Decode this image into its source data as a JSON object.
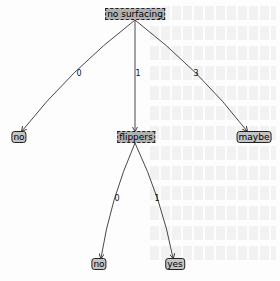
{
  "tree": {
    "root": {
      "label": "no surfacing",
      "type": "decision"
    },
    "nodes": [
      {
        "id": "root",
        "label": "no surfacing",
        "type": "decision"
      },
      {
        "id": "leaf_no_1",
        "label": "no",
        "type": "leaf"
      },
      {
        "id": "flippers",
        "label": "flippers",
        "type": "decision"
      },
      {
        "id": "leaf_maybe",
        "label": "maybe",
        "type": "leaf"
      },
      {
        "id": "leaf_no_2",
        "label": "no",
        "type": "leaf"
      },
      {
        "id": "leaf_yes",
        "label": "yes",
        "type": "leaf"
      }
    ],
    "edges": [
      {
        "from": "root",
        "to": "leaf_no_1",
        "label": "0"
      },
      {
        "from": "root",
        "to": "flippers",
        "label": "1"
      },
      {
        "from": "root",
        "to": "leaf_maybe",
        "label": "3"
      },
      {
        "from": "flippers",
        "to": "leaf_no_2",
        "label": "0"
      },
      {
        "from": "flippers",
        "to": "leaf_yes",
        "label": "1"
      }
    ]
  },
  "colors": {
    "decision_fill": "#b0b0b0",
    "leaf_fill": "#c4c4c4",
    "edge": "#333333"
  }
}
